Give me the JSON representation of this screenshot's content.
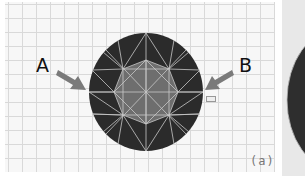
{
  "figure": {
    "labels": {
      "left": "A",
      "right": "B"
    },
    "caption": "(a)",
    "colors": {
      "stone_dark": "#2b2b2b",
      "table": "#6e6e6e",
      "facet_lines": "#c8c8c8",
      "arrow": "#7a7a7a",
      "grid": "#d9d9d9"
    }
  }
}
